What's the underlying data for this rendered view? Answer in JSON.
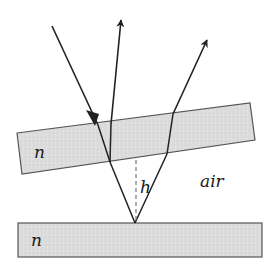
{
  "diagram": {
    "type": "optics-thin-film-wedge",
    "labels": {
      "top_plate_index": "n",
      "bottom_plate_index": "n",
      "gap_height": "h",
      "gap_medium": "air"
    },
    "colors": {
      "plate_fill": "#dcdcdc",
      "plate_stroke": "#555555",
      "ray": "#222222",
      "dashed": "#777777"
    }
  }
}
